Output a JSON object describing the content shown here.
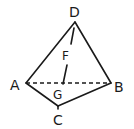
{
  "diagram": {
    "vertices": {
      "A": {
        "label": "A",
        "x": 26,
        "y": 83
      },
      "B": {
        "label": "B",
        "x": 111,
        "y": 83
      },
      "C": {
        "label": "C",
        "x": 58,
        "y": 106
      },
      "D": {
        "label": "D",
        "x": 75,
        "y": 22
      }
    },
    "points": {
      "F": {
        "label": "F"
      },
      "G": {
        "label": "G"
      }
    },
    "edges_solid": [
      "AD",
      "DB",
      "AC",
      "CB"
    ],
    "edges_dashed": [
      "AB"
    ],
    "segments": [
      "DF",
      "FG"
    ],
    "colors": {
      "stroke": "#1a1a1a",
      "background": "#ffffff"
    }
  }
}
